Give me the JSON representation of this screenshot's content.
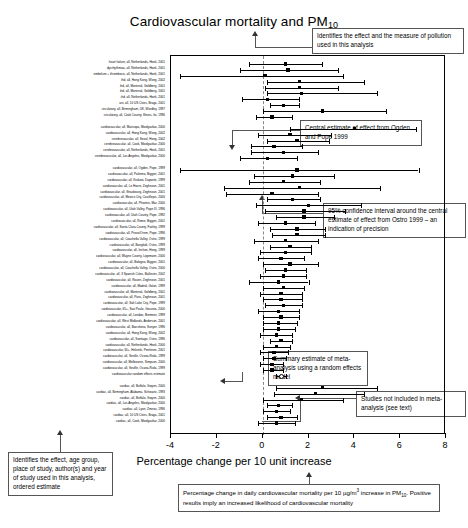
{
  "figure": {
    "title": "Cardiovascular mortality and PM",
    "title_subscript": "10",
    "x_axis_caption": "Percentage change per 10 unit increase",
    "x_axis_label": "Percentage change per 10 unit increase"
  },
  "chart_data": {
    "type": "forest",
    "title": "Cardiovascular mortality and PM10",
    "xlabel": "Percentage change per 10 unit increase",
    "ylabel": "",
    "xlim": [
      -4,
      8
    ],
    "xticks": [
      -4,
      -2,
      0,
      2,
      4,
      6,
      8
    ],
    "xticklabels": [
      "-4",
      "-2",
      "0",
      "2",
      "4",
      "6",
      "8"
    ],
    "grid": false,
    "reference_line": 0,
    "legend": "none",
    "marker_types": {
      "filled_square": "individual study central estimate",
      "open_circle": "random effects summary estimate"
    },
    "groups": [
      {
        "name": "group-1",
        "rows": [
          {
            "label": "heart failure, all, Netherlands, Hoek, 2001",
            "estimate": 1.0,
            "low": -0.6,
            "high": 2.6,
            "marker": "filled_square"
          },
          {
            "label": "dysrhythmias, all, Netherlands, Hoek, 2001",
            "estimate": 1.1,
            "low": -1.0,
            "high": 3.3,
            "marker": "filled_square"
          },
          {
            "label": "embolism + thrombosis, all, Netherlands, Hoek, 2001",
            "estimate": 0.1,
            "low": -3.6,
            "high": 3.5,
            "marker": "filled_square"
          },
          {
            "label": "ihd, all, Hong Kong, Wong, 2002",
            "estimate": 1.6,
            "low": 0.2,
            "high": 4.4,
            "marker": "filled_square"
          },
          {
            "label": "ihd, all, Montreal, Goldberg, 2001",
            "estimate": 1.6,
            "low": 0.1,
            "high": 3.3,
            "marker": "filled_square"
          },
          {
            "label": "ihd, all, Montreal, Goldberg, 2001",
            "estimate": 1.7,
            "low": 0.2,
            "high": 5.0,
            "marker": "filled_square"
          },
          {
            "label": "ihd, all, Netherlands, Hoek, 2001",
            "estimate": 0.2,
            "low": -0.9,
            "high": 1.6,
            "marker": "filled_square"
          },
          {
            "label": "arv, all, 10 US Cities, Braga, 2001",
            "estimate": 0.9,
            "low": 0.3,
            "high": 1.6,
            "marker": "filled_square"
          },
          {
            "label": "circulatory, all, Birmingham, UK, Wordley, 1997",
            "estimate": 2.6,
            "low": 0.0,
            "high": 5.4,
            "marker": "filled_square"
          },
          {
            "label": "circulatory, all, Cook County, Illinois, Ito, 1996",
            "estimate": 0.4,
            "low": -0.3,
            "high": 1.3,
            "marker": "filled_square"
          }
        ]
      },
      {
        "name": "group-2",
        "rows": [
          {
            "label": "cardiovascular, all, Maricopa, Moolgavkar, 2000",
            "estimate": 4.0,
            "low": 1.2,
            "high": 6.7,
            "marker": "filled_square"
          },
          {
            "label": "cardiovascular, all, Hong Kong, Wong, 2002",
            "estimate": 1.2,
            "low": -0.2,
            "high": 3.0,
            "marker": "filled_square"
          },
          {
            "label": "cerebrovascular, all, Seoul, Hong, 2002",
            "estimate": 1.5,
            "low": 0.2,
            "high": 2.9,
            "marker": "filled_square"
          },
          {
            "label": "cerebrovascular, all, Cook, Moolgavkar, 2000",
            "estimate": 0.5,
            "low": -0.5,
            "high": 1.7,
            "marker": "filled_square"
          },
          {
            "label": "cerebrovascular, all, Netherlands, Hoek, 2001",
            "estimate": 0.9,
            "low": -0.5,
            "high": 2.4,
            "marker": "filled_square"
          },
          {
            "label": "cerebrovascular, all, Los Angeles, Moolgavkar, 2000",
            "estimate": 0.2,
            "low": -1.0,
            "high": 1.5,
            "marker": "filled_square"
          }
        ]
      },
      {
        "name": "group-3",
        "rows": [
          {
            "label": "cardiovascular, all, Ogden, Pope, 1999",
            "estimate": 1.5,
            "low": -3.6,
            "high": 6.8,
            "marker": "filled_square"
          },
          {
            "label": "cardiovascular, all, Palermo, Biggeri, 2001",
            "estimate": 1.3,
            "low": -0.4,
            "high": 3.1,
            "marker": "filled_square"
          },
          {
            "label": "cardiovascular, all, Krakow, Daponte, 1999",
            "estimate": 0.9,
            "low": -0.6,
            "high": 2.5,
            "marker": "filled_square"
          },
          {
            "label": "cardiovascular, all, Le Havre, Zeghnoun, 2001",
            "estimate": 1.6,
            "low": -1.7,
            "high": 5.1,
            "marker": "filled_square"
          },
          {
            "label": "cardiovascular, all, Strasbourg, Zeghnoun, 2001",
            "estimate": 0.4,
            "low": -1.6,
            "high": 2.4,
            "marker": "filled_square"
          },
          {
            "label": "cardiovascular, all, Mexico City, Castillejos, 2000",
            "estimate": 1.3,
            "low": 0.2,
            "high": 2.5,
            "marker": "filled_square"
          },
          {
            "label": "cardiovascular, all, Phoenix, Mar, 2000",
            "estimate": 2.0,
            "low": -0.3,
            "high": 4.3,
            "marker": "filled_square"
          },
          {
            "label": "cardiovascular, all, Utah Valley, Pope III, 1996",
            "estimate": 1.8,
            "low": 0.1,
            "high": 3.6,
            "marker": "filled_square"
          },
          {
            "label": "cardiovascular, all, Utah County, Pope, 1992",
            "estimate": 1.8,
            "low": 0.6,
            "high": 3.1,
            "marker": "filled_square"
          },
          {
            "label": "cardiovascular, all, Rome, Biggeri, 2001",
            "estimate": 1.0,
            "low": -0.2,
            "high": 2.3,
            "marker": "filled_square"
          },
          {
            "label": "cardiovascular, all, Santa Clara County, Fairley, 1999",
            "estimate": 1.5,
            "low": 0.3,
            "high": 2.7,
            "marker": "filled_square"
          },
          {
            "label": "cardiovascular, all, Provo/Orem, Pope, 1996",
            "estimate": 1.5,
            "low": 0.4,
            "high": 2.7,
            "marker": "filled_square"
          },
          {
            "label": "cardiovascular, all, Coachella Valley, Ostro, 1999",
            "estimate": 1.0,
            "low": -0.4,
            "high": 2.4,
            "marker": "filled_square"
          },
          {
            "label": "cardiovascular, all, Bangkok, Ostro, 1999",
            "estimate": 1.2,
            "low": 0.3,
            "high": 2.1,
            "marker": "filled_square"
          },
          {
            "label": "cardiovascular, all, Inchon, Hong, 1999",
            "estimate": 1.0,
            "low": -0.1,
            "high": 2.1,
            "marker": "filled_square"
          },
          {
            "label": "cardiovascular, all, Wayne County, Lippmann, 2000",
            "estimate": 0.8,
            "low": -0.2,
            "high": 1.8,
            "marker": "filled_square"
          },
          {
            "label": "cardiovascular, all, Bologna, Biggeri, 2001",
            "estimate": 1.2,
            "low": 0.0,
            "high": 2.4,
            "marker": "filled_square"
          },
          {
            "label": "cardiovascular, all, Coachella Valley, Ostro, 2000",
            "estimate": 1.0,
            "low": 0.1,
            "high": 1.9,
            "marker": "filled_square"
          },
          {
            "label": "cardiovascular, all, 3 Spanish Cities, Ballester, 2002",
            "estimate": 0.9,
            "low": -0.1,
            "high": 1.9,
            "marker": "filled_square"
          },
          {
            "label": "cardiovascular, all, Rouen, Zeghnoun, 2001",
            "estimate": 0.7,
            "low": -0.6,
            "high": 2.0,
            "marker": "filled_square"
          },
          {
            "label": "cardiovascular, all, Madrid, Galan, 1999",
            "estimate": 0.9,
            "low": 0.0,
            "high": 1.8,
            "marker": "filled_square"
          },
          {
            "label": "cardiovascular, all, Montreal, Goldberg, 2001",
            "estimate": 0.8,
            "low": -0.1,
            "high": 1.7,
            "marker": "filled_square"
          },
          {
            "label": "cardiovascular, all, Paris, Zeghnoun, 2001",
            "estimate": 0.8,
            "low": 0.0,
            "high": 1.7,
            "marker": "filled_square"
          },
          {
            "label": "cardiovascular, all, Salt Lake City, Pope, 1999",
            "estimate": 0.9,
            "low": 0.1,
            "high": 1.7,
            "marker": "filled_square"
          },
          {
            "label": "cardiovascular, 65+, Sao Paulo, Gouveia, 2000",
            "estimate": 0.7,
            "low": -0.2,
            "high": 1.6,
            "marker": "filled_square"
          },
          {
            "label": "cardiovascular, all, London, Bremner, 1999",
            "estimate": 0.8,
            "low": 0.0,
            "high": 1.6,
            "marker": "filled_square"
          },
          {
            "label": "cardiovascular, all, West Midlands, Anderson, 2001",
            "estimate": 0.7,
            "low": 0.0,
            "high": 1.5,
            "marker": "filled_square"
          },
          {
            "label": "cardiovascular, all, Barcelona, Sunyer, 1996",
            "estimate": 0.7,
            "low": 0.0,
            "high": 1.4,
            "marker": "filled_square"
          },
          {
            "label": "cardiovascular, all, Hong Kong, Wong, 2002",
            "estimate": 0.6,
            "low": -0.1,
            "high": 1.3,
            "marker": "filled_square"
          },
          {
            "label": "cardiovascular, all, Santiago, Ostro, 1996",
            "estimate": 0.8,
            "low": 0.3,
            "high": 1.3,
            "marker": "filled_square"
          },
          {
            "label": "cardiovascular, all, Netherlands, Hoek, 2000",
            "estimate": 0.6,
            "low": 0.0,
            "high": 1.2,
            "marker": "filled_square"
          },
          {
            "label": "cardiovascular, 65+, Helsinki, Penttinen, 2001",
            "estimate": 0.5,
            "low": -0.1,
            "high": 1.1,
            "marker": "filled_square"
          },
          {
            "label": "cardiovascular, all, Seville, Ocana-Riola, 1999",
            "estimate": 0.5,
            "low": 0.0,
            "high": 1.0,
            "marker": "filled_square"
          },
          {
            "label": "cardiovascular, all, Melbourne, Simpson, 2000",
            "estimate": 0.4,
            "low": -0.1,
            "high": 0.9,
            "marker": "filled_square"
          },
          {
            "label": "cardiovascular, all, Seville, Ocana-Riola, 1999",
            "estimate": 0.4,
            "low": 0.0,
            "high": 0.9,
            "marker": "filled_square"
          },
          {
            "label": "cardiovascular random effects estimate",
            "estimate": 0.8,
            "low": 0.6,
            "high": 1.0,
            "marker": "open_circle"
          }
        ]
      },
      {
        "name": "group-4-excluded",
        "rows": [
          {
            "label": "cardiac, all, Buffalo, Gwynn, 2000",
            "estimate": 2.6,
            "low": 0.6,
            "high": 5.0,
            "marker": "filled_square"
          },
          {
            "label": "cardiac, all, Birmingham, Alabama, Schwartz, 1993",
            "estimate": 2.3,
            "low": 0.5,
            "high": 4.4,
            "marker": "filled_square"
          },
          {
            "label": "cardiac, all, Buffalo, Gwynn, 2000",
            "estimate": 1.7,
            "low": 0.0,
            "high": 3.5,
            "marker": "filled_square"
          },
          {
            "label": "cardiac, all, Los Angeles, Moolgavkar, 2000",
            "estimate": 0.7,
            "low": 0.2,
            "high": 1.3,
            "marker": "filled_square"
          },
          {
            "label": "cardiac, all, Lyon, Zmirou, 1996",
            "estimate": 0.6,
            "low": 0.0,
            "high": 1.2,
            "marker": "filled_square"
          },
          {
            "label": "cardiac, all, 10 US Cities, Braga, 2001",
            "estimate": 0.8,
            "low": 0.2,
            "high": 1.5,
            "marker": "filled_square"
          },
          {
            "label": "cardiac, all, Cook, Moolgavkar, 2000",
            "estimate": 0.6,
            "low": -0.2,
            "high": 1.4,
            "marker": "filled_square"
          }
        ]
      }
    ]
  },
  "annotations": {
    "title_note": "Identifies the effect and the measure of pollution used in this analysis",
    "central_estimate_note": "Central estimate of effect from Ogden and Pope 1999",
    "confidence_interval_note": "95% confidence interval around the central estimate of effect from Ostro 1999 – an indication of precision",
    "summary_note": "Summary estimate of meta-analysis using a random effects model",
    "excluded_note": "Studies not included in meta-analysis (see text)",
    "labels_note": "Identifies the effect, age group, place of study, author(s) and year of study used in this analysis, ordered estimate",
    "xaxis_note_part1": "Percentage change in daily cardiovascular mortality per 10 µg/m",
    "xaxis_note_part2": "increase in PM",
    "xaxis_note_sub": "10",
    "xaxis_note_part3": ". Positive results imply an increased likelihood of cardiovascular mortality"
  },
  "footer": {
    "page_marker": ""
  }
}
